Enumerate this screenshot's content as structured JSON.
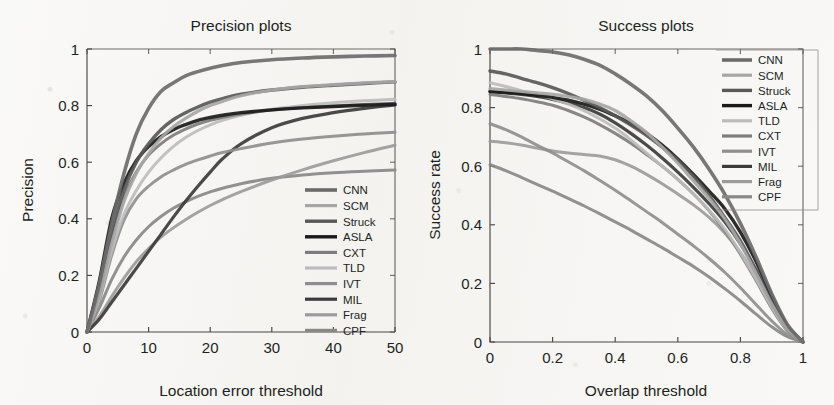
{
  "figure": {
    "kind": "two-panel-grayscale-line-plots",
    "background_color": "#f3f2ef",
    "ink_color": "#231f1d"
  },
  "series_styles": {
    "CNN": {
      "color": "#6b6b6b",
      "width": 3.6
    },
    "SCM": {
      "color": "#a6a6a6",
      "width": 3.2
    },
    "Struck": {
      "color": "#585858",
      "width": 3.4
    },
    "ASLA": {
      "color": "#1a1a1a",
      "width": 3.4
    },
    "CXT": {
      "color": "#7d7d7d",
      "width": 3.0
    },
    "TLD": {
      "color": "#bcbcbc",
      "width": 3.0
    },
    "IVT": {
      "color": "#8e8e8e",
      "width": 3.0
    },
    "MIL": {
      "color": "#3b3b3b",
      "width": 3.2
    },
    "Frag": {
      "color": "#9b9b9b",
      "width": 3.0
    },
    "CPF": {
      "color": "#888888",
      "width": 3.0
    }
  },
  "chart_data": [
    {
      "id": "precision",
      "type": "line",
      "title": "Precision plots",
      "xlabel": "Location error threshold",
      "ylabel": "Precision",
      "xlim": [
        0,
        50
      ],
      "ylim": [
        0,
        1
      ],
      "xticks": [
        0,
        10,
        20,
        30,
        40,
        50
      ],
      "xticklabels": [
        "0",
        "10",
        "20",
        "30",
        "40",
        "50"
      ],
      "yticks": [
        0,
        0.2,
        0.4,
        0.6,
        0.8,
        1
      ],
      "yticklabels": [
        "0",
        "0.2",
        "0.4",
        "0.6",
        "0.8",
        "1"
      ],
      "grid": false,
      "legend_position": "inside-bottom-right",
      "legend_entries": [
        "CNN",
        "SCM",
        "Struck",
        "ASLA",
        "CXT",
        "TLD",
        "IVT",
        "MIL",
        "Frag",
        "CPF"
      ],
      "x": [
        0,
        2,
        4,
        6,
        8,
        10,
        12,
        14,
        16,
        18,
        20,
        22,
        25,
        30,
        35,
        40,
        45,
        50
      ],
      "series": [
        {
          "name": "CNN",
          "values": [
            0.0,
            0.17,
            0.38,
            0.56,
            0.7,
            0.79,
            0.85,
            0.88,
            0.905,
            0.92,
            0.932,
            0.942,
            0.952,
            0.962,
            0.968,
            0.972,
            0.975,
            0.977
          ]
        },
        {
          "name": "SCM",
          "values": [
            0.0,
            0.13,
            0.31,
            0.46,
            0.56,
            0.63,
            0.685,
            0.725,
            0.755,
            0.78,
            0.8,
            0.815,
            0.835,
            0.855,
            0.867,
            0.874,
            0.88,
            0.885
          ]
        },
        {
          "name": "Struck",
          "values": [
            0.0,
            0.15,
            0.35,
            0.5,
            0.6,
            0.665,
            0.715,
            0.75,
            0.775,
            0.795,
            0.812,
            0.825,
            0.84,
            0.855,
            0.865,
            0.872,
            0.878,
            0.884
          ]
        },
        {
          "name": "ASLA",
          "values": [
            0.0,
            0.18,
            0.4,
            0.525,
            0.605,
            0.655,
            0.69,
            0.715,
            0.733,
            0.748,
            0.758,
            0.766,
            0.775,
            0.785,
            0.792,
            0.797,
            0.801,
            0.805
          ]
        },
        {
          "name": "CXT",
          "values": [
            0.0,
            0.14,
            0.33,
            0.475,
            0.565,
            0.625,
            0.665,
            0.695,
            0.717,
            0.735,
            0.748,
            0.758,
            0.77,
            0.784,
            0.793,
            0.799,
            0.804,
            0.808
          ]
        },
        {
          "name": "TLD",
          "values": [
            0.0,
            0.12,
            0.285,
            0.415,
            0.5,
            0.565,
            0.615,
            0.655,
            0.687,
            0.712,
            0.732,
            0.748,
            0.766,
            0.787,
            0.8,
            0.81,
            0.817,
            0.822
          ]
        },
        {
          "name": "IVT",
          "values": [
            0.0,
            0.11,
            0.27,
            0.395,
            0.47,
            0.515,
            0.548,
            0.572,
            0.592,
            0.608,
            0.622,
            0.634,
            0.648,
            0.668,
            0.682,
            0.692,
            0.7,
            0.706
          ]
        },
        {
          "name": "MIL",
          "values": [
            0.0,
            0.045,
            0.105,
            0.165,
            0.225,
            0.285,
            0.345,
            0.405,
            0.462,
            0.515,
            0.565,
            0.612,
            0.665,
            0.722,
            0.755,
            0.775,
            0.79,
            0.802
          ]
        },
        {
          "name": "Frag",
          "values": [
            0.0,
            0.055,
            0.125,
            0.19,
            0.248,
            0.295,
            0.335,
            0.368,
            0.397,
            0.423,
            0.447,
            0.468,
            0.496,
            0.537,
            0.573,
            0.605,
            0.634,
            0.66
          ]
        },
        {
          "name": "CPF",
          "values": [
            0.0,
            0.085,
            0.185,
            0.265,
            0.325,
            0.372,
            0.408,
            0.437,
            0.46,
            0.479,
            0.495,
            0.508,
            0.524,
            0.543,
            0.555,
            0.563,
            0.568,
            0.572
          ]
        }
      ]
    },
    {
      "id": "success",
      "type": "line",
      "title": "Success plots",
      "xlabel": "Overlap threshold",
      "ylabel": "Success rate",
      "xlim": [
        0,
        1
      ],
      "ylim": [
        0,
        1
      ],
      "xticks": [
        0,
        0.2,
        0.4,
        0.6,
        0.8,
        1
      ],
      "xticklabels": [
        "0",
        "0.2",
        "0.4",
        "0.6",
        "0.8",
        "1"
      ],
      "yticks": [
        0,
        0.2,
        0.4,
        0.6,
        0.8,
        1
      ],
      "yticklabels": [
        "0",
        "0.2",
        "0.4",
        "0.6",
        "0.8",
        "1"
      ],
      "grid": false,
      "legend_position": "outside-top-right",
      "legend_entries": [
        "CNN",
        "SCM",
        "Struck",
        "ASLA",
        "TLD",
        "CXT",
        "IVT",
        "MIL",
        "Frag",
        "CPF"
      ],
      "x": [
        0,
        0.05,
        0.1,
        0.15,
        0.2,
        0.25,
        0.3,
        0.35,
        0.4,
        0.45,
        0.5,
        0.55,
        0.6,
        0.65,
        0.7,
        0.75,
        0.8,
        0.85,
        0.9,
        0.95,
        1.0
      ],
      "series": [
        {
          "name": "CNN",
          "values": [
            1.0,
            1.0,
            1.0,
            0.995,
            0.99,
            0.98,
            0.965,
            0.945,
            0.915,
            0.88,
            0.84,
            0.79,
            0.73,
            0.665,
            0.59,
            0.505,
            0.405,
            0.29,
            0.165,
            0.06,
            0.0
          ]
        },
        {
          "name": "SCM",
          "values": [
            0.865,
            0.86,
            0.855,
            0.85,
            0.845,
            0.838,
            0.828,
            0.812,
            0.79,
            0.755,
            0.715,
            0.665,
            0.61,
            0.55,
            0.49,
            0.42,
            0.335,
            0.235,
            0.13,
            0.045,
            0.0
          ]
        },
        {
          "name": "Struck",
          "values": [
            0.925,
            0.915,
            0.9,
            0.885,
            0.868,
            0.848,
            0.825,
            0.8,
            0.772,
            0.74,
            0.705,
            0.665,
            0.62,
            0.565,
            0.5,
            0.425,
            0.345,
            0.245,
            0.135,
            0.045,
            0.0
          ]
        },
        {
          "name": "ASLA",
          "values": [
            0.855,
            0.852,
            0.848,
            0.842,
            0.835,
            0.825,
            0.812,
            0.795,
            0.772,
            0.745,
            0.712,
            0.672,
            0.625,
            0.572,
            0.515,
            0.455,
            0.375,
            0.275,
            0.155,
            0.055,
            0.0
          ]
        },
        {
          "name": "TLD",
          "values": [
            0.885,
            0.872,
            0.858,
            0.845,
            0.83,
            0.812,
            0.79,
            0.762,
            0.73,
            0.69,
            0.645,
            0.6,
            0.555,
            0.505,
            0.45,
            0.385,
            0.305,
            0.215,
            0.12,
            0.04,
            0.0
          ]
        },
        {
          "name": "CXT",
          "values": [
            0.845,
            0.838,
            0.83,
            0.82,
            0.808,
            0.79,
            0.768,
            0.742,
            0.712,
            0.678,
            0.64,
            0.6,
            0.555,
            0.505,
            0.448,
            0.38,
            0.3,
            0.21,
            0.115,
            0.038,
            0.0
          ]
        },
        {
          "name": "IVT",
          "values": [
            0.745,
            0.725,
            0.7,
            0.672,
            0.645,
            0.615,
            0.585,
            0.552,
            0.518,
            0.482,
            0.445,
            0.408,
            0.368,
            0.328,
            0.285,
            0.238,
            0.185,
            0.128,
            0.072,
            0.025,
            0.0
          ]
        },
        {
          "name": "MIL",
          "values": [
            0.855,
            0.85,
            0.845,
            0.838,
            0.828,
            0.815,
            0.8,
            0.778,
            0.748,
            0.712,
            0.672,
            0.628,
            0.58,
            0.528,
            0.472,
            0.41,
            0.335,
            0.245,
            0.14,
            0.048,
            0.0
          ]
        },
        {
          "name": "Frag",
          "values": [
            0.685,
            0.68,
            0.672,
            0.662,
            0.652,
            0.645,
            0.64,
            0.635,
            0.622,
            0.6,
            0.572,
            0.54,
            0.505,
            0.468,
            0.425,
            0.372,
            0.305,
            0.222,
            0.128,
            0.042,
            0.0
          ]
        },
        {
          "name": "CPF",
          "values": [
            0.605,
            0.585,
            0.562,
            0.538,
            0.515,
            0.49,
            0.465,
            0.438,
            0.41,
            0.382,
            0.352,
            0.322,
            0.29,
            0.258,
            0.222,
            0.182,
            0.14,
            0.095,
            0.052,
            0.018,
            0.0
          ]
        }
      ]
    }
  ]
}
